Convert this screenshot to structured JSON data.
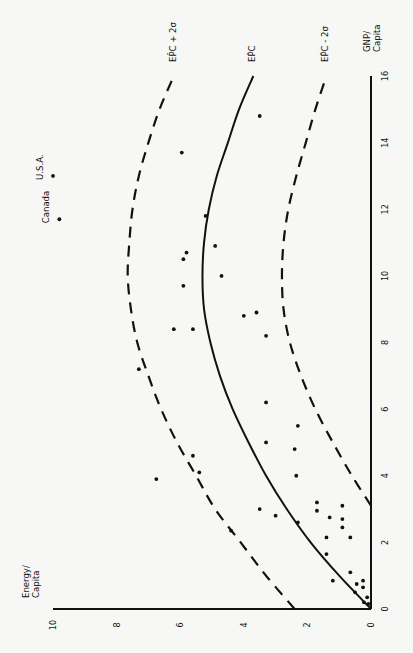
{
  "chart_data": {
    "type": "scatter",
    "title": "",
    "orientation": "rotated 90° counter-clockwise (GNP axis vertical on right, Energy axis horizontal at bottom)",
    "xlabel": "GNP/ Capita",
    "ylabel": "Energy/ Capita",
    "xlim": [
      0,
      16
    ],
    "ylim": [
      0,
      10
    ],
    "x_ticks": [
      0,
      2,
      4,
      6,
      8,
      10,
      12,
      14,
      16
    ],
    "y_ticks": [
      0,
      2,
      4,
      6,
      8,
      10
    ],
    "grid": false,
    "legend": "none (curves labeled inline)",
    "curves": [
      {
        "name": "EPC + 2σ",
        "label": "EP̂C + 2σ",
        "style": "dashed",
        "x": [
          0,
          1,
          2,
          3,
          4,
          5,
          6,
          7,
          8,
          9,
          10,
          11,
          12,
          13,
          14,
          15,
          16
        ],
        "y": [
          2.4,
          3.3,
          4.1,
          4.9,
          5.5,
          6.1,
          6.6,
          7.0,
          7.35,
          7.55,
          7.65,
          7.6,
          7.5,
          7.3,
          7.0,
          6.65,
          6.2
        ]
      },
      {
        "name": "EPC",
        "label": "EP̂C",
        "style": "solid",
        "x": [
          0,
          1,
          2,
          3,
          4,
          5,
          6,
          7,
          8,
          9,
          10,
          11,
          12,
          13,
          14,
          15,
          16
        ],
        "y": [
          0,
          1.0,
          1.9,
          2.65,
          3.3,
          3.85,
          4.35,
          4.75,
          5.05,
          5.25,
          5.3,
          5.25,
          5.1,
          4.85,
          4.5,
          4.15,
          3.7
        ]
      },
      {
        "name": "EPC - 2σ",
        "label": "EP̂C - 2σ",
        "style": "dashed",
        "x": [
          3.1,
          4,
          5,
          6,
          7,
          8,
          9,
          10,
          11,
          12,
          13,
          14,
          15,
          16
        ],
        "y": [
          0,
          0.6,
          1.2,
          1.75,
          2.2,
          2.55,
          2.75,
          2.8,
          2.75,
          2.6,
          2.35,
          2.05,
          1.75,
          1.4
        ]
      }
    ],
    "points": [
      {
        "x": 13.0,
        "y": 10.0,
        "label": "U.S.A."
      },
      {
        "x": 11.7,
        "y": 9.8,
        "label": "Canada"
      },
      {
        "x": 14.8,
        "y": 3.5
      },
      {
        "x": 13.7,
        "y": 5.95
      },
      {
        "x": 11.8,
        "y": 5.2
      },
      {
        "x": 10.9,
        "y": 4.9
      },
      {
        "x": 10.7,
        "y": 5.8
      },
      {
        "x": 10.5,
        "y": 5.9
      },
      {
        "x": 10.0,
        "y": 4.7
      },
      {
        "x": 9.7,
        "y": 5.9
      },
      {
        "x": 8.9,
        "y": 3.6
      },
      {
        "x": 8.8,
        "y": 4.0
      },
      {
        "x": 8.4,
        "y": 6.2
      },
      {
        "x": 8.4,
        "y": 5.6
      },
      {
        "x": 8.2,
        "y": 3.3
      },
      {
        "x": 7.2,
        "y": 7.3
      },
      {
        "x": 6.2,
        "y": 3.3
      },
      {
        "x": 5.5,
        "y": 2.3
      },
      {
        "x": 5.0,
        "y": 3.3
      },
      {
        "x": 4.8,
        "y": 2.4
      },
      {
        "x": 4.6,
        "y": 5.6
      },
      {
        "x": 4.1,
        "y": 5.4
      },
      {
        "x": 4.0,
        "y": 2.35
      },
      {
        "x": 3.9,
        "y": 6.75
      },
      {
        "x": 3.2,
        "y": 1.7
      },
      {
        "x": 3.1,
        "y": 0.9
      },
      {
        "x": 3.0,
        "y": 3.5
      },
      {
        "x": 2.95,
        "y": 1.7
      },
      {
        "x": 2.8,
        "y": 3.0
      },
      {
        "x": 2.75,
        "y": 1.3
      },
      {
        "x": 2.7,
        "y": 0.9
      },
      {
        "x": 2.6,
        "y": 2.3
      },
      {
        "x": 2.45,
        "y": 0.9
      },
      {
        "x": 2.35,
        "y": 4.4
      },
      {
        "x": 2.15,
        "y": 1.4
      },
      {
        "x": 2.15,
        "y": 0.65
      },
      {
        "x": 1.65,
        "y": 1.4
      },
      {
        "x": 1.1,
        "y": 0.65
      },
      {
        "x": 0.85,
        "y": 1.2
      },
      {
        "x": 0.85,
        "y": 0.25
      },
      {
        "x": 0.75,
        "y": 0.45
      },
      {
        "x": 0.65,
        "y": 0.25
      },
      {
        "x": 0.5,
        "y": 0.5
      },
      {
        "x": 0.35,
        "y": 0.12
      },
      {
        "x": 0.2,
        "y": 0.22
      },
      {
        "x": 0.15,
        "y": 0.08
      }
    ],
    "annotations": [
      "U.S.A.",
      "Canada"
    ]
  },
  "axes": {
    "gnp_label_line1": "GNP/",
    "gnp_label_line2": "Capita",
    "energy_label_line1": "Energy/",
    "energy_label_line2": "Capita"
  },
  "colors": {
    "ink": "#111111",
    "paper": "#f7f7f5"
  }
}
